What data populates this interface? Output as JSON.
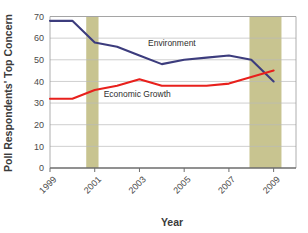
{
  "chart_data": {
    "type": "line",
    "title": "",
    "xlabel": "Year",
    "ylabel": "Poll Respondents' Top Concern",
    "x": [
      1999,
      2000,
      2001,
      2002,
      2003,
      2004,
      2005,
      2006,
      2007,
      2008,
      2009
    ],
    "xlim": [
      1999,
      2010
    ],
    "ylim": [
      0,
      70
    ],
    "xticks": [
      1999,
      2001,
      2003,
      2005,
      2007,
      2009
    ],
    "xtick_labels": [
      "1999",
      "2001",
      "2003",
      "2005",
      "2007",
      "2009"
    ],
    "yticks": [
      0,
      10,
      20,
      30,
      40,
      50,
      60,
      70
    ],
    "ytick_labels": [
      "0",
      "10",
      "20",
      "30",
      "40",
      "50",
      "60",
      "70"
    ],
    "grid": "horizontal",
    "legend_position": "inline-labels",
    "series": [
      {
        "name": "Environment",
        "color": "#3c3c7d",
        "label_x": 2004.45,
        "label_y": 56.5,
        "values": [
          68,
          68,
          58,
          56,
          52,
          48,
          50,
          51,
          52,
          50,
          40
        ]
      },
      {
        "name": "Economic Growth",
        "color": "#e8201c",
        "label_x": 2002.9,
        "label_y": 33.0,
        "values": [
          32,
          32,
          36,
          38,
          41,
          38,
          38,
          38,
          39,
          42,
          45
        ]
      }
    ],
    "shaded_bands": [
      {
        "name": "recession-band-2001",
        "x_start": 2000.62,
        "x_end": 2001.17,
        "color": "#c8c490"
      },
      {
        "name": "recession-band-2008",
        "x_start": 2007.92,
        "x_end": 2009.35,
        "color": "#c8c490"
      }
    ]
  }
}
